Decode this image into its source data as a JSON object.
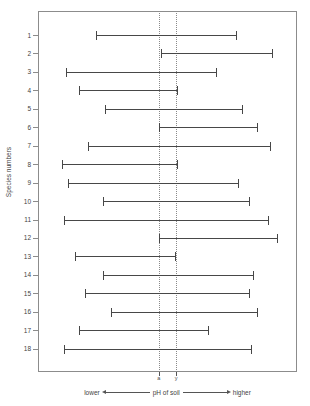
{
  "figure": {
    "y_axis_title": "Species numbers",
    "x_axis_name": "pH of soil",
    "x_low_label": "lower",
    "x_high_label": "higher"
  },
  "chart_data": {
    "type": "bar",
    "orientation": "horizontal",
    "title": "",
    "subtitle": "",
    "xlabel": "pH of soil",
    "ylabel": "Species numbers",
    "xlim": [
      3.0,
      9.0
    ],
    "grid": false,
    "legend": null,
    "categories": [
      "1",
      "2",
      "3",
      "4",
      "5",
      "6",
      "7",
      "8",
      "9",
      "10",
      "11",
      "12",
      "13",
      "14",
      "15",
      "16",
      "17",
      "18"
    ],
    "value_type": "range",
    "ranges": [
      {
        "species": "1",
        "low": 4.35,
        "high": 7.6
      },
      {
        "species": "2",
        "low": 5.85,
        "high": 8.45
      },
      {
        "species": "3",
        "low": 3.65,
        "high": 7.15
      },
      {
        "species": "4",
        "low": 3.95,
        "high": 6.25
      },
      {
        "species": "5",
        "low": 4.55,
        "high": 7.75
      },
      {
        "species": "6",
        "low": 5.8,
        "high": 8.1
      },
      {
        "species": "7",
        "low": 4.15,
        "high": 8.4
      },
      {
        "species": "8",
        "low": 3.55,
        "high": 6.25
      },
      {
        "species": "9",
        "low": 3.7,
        "high": 7.65
      },
      {
        "species": "10",
        "low": 4.5,
        "high": 7.9
      },
      {
        "species": "11",
        "low": 3.6,
        "high": 8.35
      },
      {
        "species": "12",
        "low": 5.8,
        "high": 8.55
      },
      {
        "species": "13",
        "low": 3.85,
        "high": 6.2
      },
      {
        "species": "14",
        "low": 4.5,
        "high": 8.0
      },
      {
        "species": "15",
        "low": 4.1,
        "high": 7.9
      },
      {
        "species": "16",
        "low": 4.7,
        "high": 8.1
      },
      {
        "species": "17",
        "low": 3.95,
        "high": 6.95
      },
      {
        "species": "18",
        "low": 3.6,
        "high": 7.95
      }
    ],
    "reference_lines": [
      {
        "label": "a",
        "value": 5.8
      },
      {
        "label": "y",
        "value": 6.2
      }
    ],
    "x_ticks": [
      {
        "label": "a",
        "value": 5.8
      },
      {
        "label": "y",
        "value": 6.2
      }
    ]
  }
}
